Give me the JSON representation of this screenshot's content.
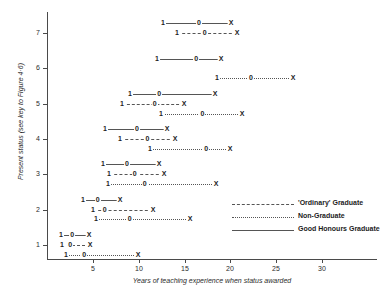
{
  "chart_data": {
    "type": "line",
    "title": "",
    "xlabel": "Years of teaching experience when status awarded",
    "ylabel": "Present status (see key to Figure 4·6)",
    "xlim": [
      0,
      36
    ],
    "ylim": [
      0.6,
      7.6
    ],
    "grid": false,
    "legend_position": "inside-right",
    "x_ticks": [
      5,
      10,
      15,
      20,
      25,
      30
    ],
    "y_ticks": [
      1,
      2,
      3,
      4,
      5,
      6,
      7
    ],
    "point_labels": [
      "1",
      "0",
      "X"
    ],
    "legend": [
      {
        "name": "'Ordinary' Graduate",
        "style": "dashed"
      },
      {
        "name": "Non-Graduate",
        "style": "dotted"
      },
      {
        "name": "Good Honours Graduate",
        "style": "solid"
      }
    ],
    "series": [
      {
        "name": "Good Honours Graduate",
        "style": "solid",
        "rows": [
          {
            "status": 7,
            "offset": 0.28,
            "quartile_1": 12.7,
            "median": 16.6,
            "quartile_3": 20.1
          },
          {
            "status": 6,
            "offset": 0.28,
            "quartile_1": 12.0,
            "median": 16.3,
            "quartile_3": 19.0
          },
          {
            "status": 5,
            "offset": 0.28,
            "quartile_1": 9.1,
            "median": 12.3,
            "quartile_3": 18.4
          },
          {
            "status": 4,
            "offset": 0.28,
            "quartile_1": 6.3,
            "median": 9.8,
            "quartile_3": 13.1
          },
          {
            "status": 3,
            "offset": 0.28,
            "quartile_1": 6.1,
            "median": 8.7,
            "quartile_3": 12.2
          },
          {
            "status": 2,
            "offset": 0.28,
            "quartile_1": 3.9,
            "median": 5.5,
            "quartile_3": 7.9
          },
          {
            "status": 1,
            "offset": 0.28,
            "quartile_1": 1.5,
            "median": 2.7,
            "quartile_3": 4.5
          }
        ]
      },
      {
        "name": "'Ordinary' Graduate",
        "style": "dashed",
        "rows": [
          {
            "status": 7,
            "offset": 0.0,
            "quartile_1": 14.2,
            "median": 17.2,
            "quartile_3": 20.7
          },
          {
            "status": 5,
            "offset": 0.0,
            "quartile_1": 8.2,
            "median": 11.8,
            "quartile_3": 15.0
          },
          {
            "status": 4,
            "offset": 0.0,
            "quartile_1": 8.0,
            "median": 11.0,
            "quartile_3": 14.0
          },
          {
            "status": 3,
            "offset": 0.0,
            "quartile_1": 6.8,
            "median": 9.6,
            "quartile_3": 12.8
          },
          {
            "status": 2,
            "offset": 0.0,
            "quartile_1": 5.0,
            "median": 6.3,
            "quartile_3": 11.6
          },
          {
            "status": 1,
            "offset": 0.0,
            "quartile_1": 1.6,
            "median": 2.5,
            "quartile_3": 4.7
          }
        ]
      },
      {
        "name": "Non-Graduate",
        "style": "dotted",
        "rows": [
          {
            "status": 6,
            "offset": -0.28,
            "quartile_1": 18.5,
            "median": 22.2,
            "quartile_3": 26.8
          },
          {
            "status": 5,
            "offset": -0.28,
            "quartile_1": 12.4,
            "median": 16.9,
            "quartile_3": 21.2
          },
          {
            "status": 4,
            "offset": -0.28,
            "quartile_1": 11.2,
            "median": 17.3,
            "quartile_3": 19.9
          },
          {
            "status": 3,
            "offset": -0.28,
            "quartile_1": 6.6,
            "median": 10.6,
            "quartile_3": 18.4
          },
          {
            "status": 2,
            "offset": -0.28,
            "quartile_1": 5.3,
            "median": 9.0,
            "quartile_3": 15.6
          },
          {
            "status": 1,
            "offset": -0.28,
            "quartile_1": 2.1,
            "median": 4.1,
            "quartile_3": 10.0
          }
        ]
      }
    ]
  }
}
